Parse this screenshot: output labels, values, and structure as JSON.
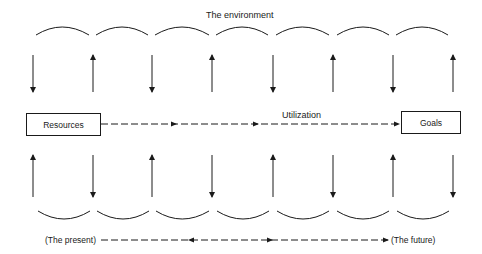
{
  "diagram": {
    "top_label": "The environment",
    "middle_label": "Utilization",
    "left_box": "Resources",
    "right_box": "Goals",
    "timeline_start": "(The present)",
    "timeline_end": "(The future)",
    "top_arcs_count": 7,
    "bottom_arcs_count": 7,
    "top_arrows": [
      "down",
      "up",
      "down",
      "up",
      "down",
      "up",
      "down",
      "up"
    ],
    "bottom_arrows": [
      "up",
      "down",
      "up",
      "down",
      "up",
      "down",
      "up",
      "down"
    ],
    "line_color": "#1a1a1a"
  }
}
